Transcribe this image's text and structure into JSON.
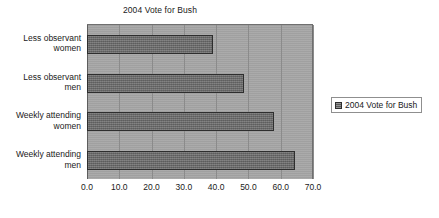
{
  "chart_data": {
    "type": "bar",
    "orientation": "horizontal",
    "title": "2004 Vote for Bush",
    "xlabel": "",
    "ylabel": "",
    "categories": [
      "Weekly attending men",
      "Weekly attending women",
      "Less observant men",
      "Less observant women"
    ],
    "category_lines": [
      [
        "Weekly attending",
        "men"
      ],
      [
        "Weekly attending",
        "women"
      ],
      [
        "Less observant",
        "men"
      ],
      [
        "Less observant",
        "women"
      ]
    ],
    "values": [
      64.5,
      58.0,
      48.5,
      39.0
    ],
    "series": [
      {
        "name": "2004 Vote for Bush",
        "values": [
          64.5,
          58.0,
          48.5,
          39.0
        ]
      }
    ],
    "xlim": [
      0.0,
      70.0
    ],
    "xticks": [
      0.0,
      10.0,
      20.0,
      30.0,
      40.0,
      50.0,
      60.0,
      70.0
    ],
    "xtick_labels": [
      "0.0",
      "10.0",
      "20.0",
      "30.0",
      "40.0",
      "50.0",
      "60.0",
      "70.0"
    ],
    "grid": true,
    "grid_axis": "x",
    "legend": {
      "position": "right",
      "entries": [
        "2004 Vote for Bush"
      ]
    },
    "colors": {
      "bar_fill": "#6e6e6e",
      "bar_border": "#2e2e2e",
      "plot_background": "#a6a6a6",
      "gridline": "#8b8b8b",
      "page_background": "#ffffff",
      "text": "#1a1a1a",
      "legend_border": "#8f8f8f"
    }
  }
}
